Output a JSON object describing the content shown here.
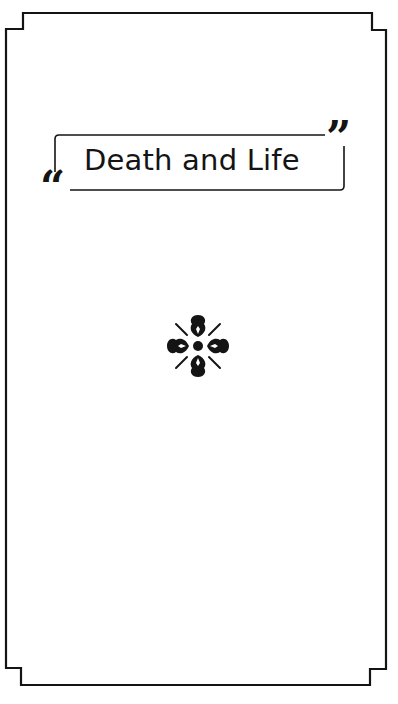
{
  "page": {
    "title": "Death and Life",
    "open_quote": "“",
    "close_quote": "”",
    "ornament": "flower-ornament-icon"
  },
  "colors": {
    "ink": "#141414",
    "background": "#ffffff"
  }
}
